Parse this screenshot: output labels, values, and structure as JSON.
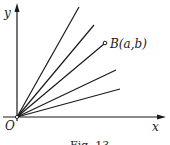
{
  "figure": {
    "axis_labels": {
      "x": "x",
      "y": "y",
      "origin": "O"
    },
    "point_label": "B(a,b)",
    "caption": "Fig. 13",
    "colors": {
      "stroke": "#1a1a1a",
      "background": "#ffffff"
    },
    "origin_px": [
      17,
      117
    ],
    "rays": [
      {
        "name": "ray-1",
        "end": [
          79,
          7
        ]
      },
      {
        "name": "ray-2",
        "end": [
          94,
          25
        ]
      },
      {
        "name": "ray-3-to-B",
        "end": [
          105,
          43
        ]
      },
      {
        "name": "ray-4",
        "end": [
          116,
          70
        ]
      },
      {
        "name": "ray-5",
        "end": [
          120,
          89
        ]
      }
    ]
  }
}
